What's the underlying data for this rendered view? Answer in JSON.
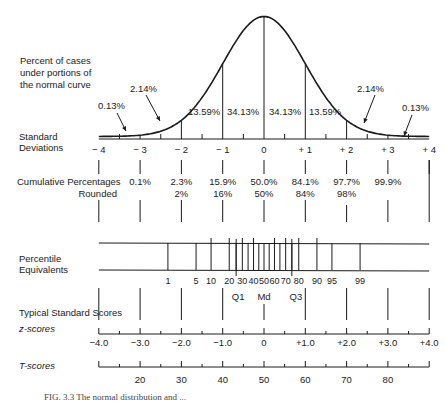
{
  "chart_data": {
    "type": "line",
    "caption": "FIG. 3.3  The normal distribution and ...",
    "curve_label": [
      "Percent of cases",
      "under portions of",
      "the normal curve"
    ],
    "standard_deviations": {
      "label": [
        "Standard",
        "Deviations"
      ],
      "ticks": [
        "− 4",
        "− 3",
        "− 2",
        "− 1",
        "0",
        "+ 1",
        "+ 2",
        "+ 3",
        "+ 4"
      ],
      "values": [
        -4,
        -3,
        -2,
        -1,
        0,
        1,
        2,
        3,
        4
      ]
    },
    "area_percentages": [
      {
        "from": -4,
        "to": -3,
        "value": "0.13%"
      },
      {
        "from": -3,
        "to": -2,
        "value": "2.14%"
      },
      {
        "from": -2,
        "to": -1,
        "value": "13.59%"
      },
      {
        "from": -1,
        "to": 0,
        "value": "34.13%"
      },
      {
        "from": 0,
        "to": 1,
        "value": "34.13%"
      },
      {
        "from": 1,
        "to": 2,
        "value": "13.59%"
      },
      {
        "from": 2,
        "to": 3,
        "value": "2.14%"
      },
      {
        "from": 3,
        "to": 4,
        "value": "0.13%"
      }
    ],
    "cumulative_percentages": {
      "label": "Cumulative Percentages",
      "rounded_label": "Rounded",
      "values": [
        "0.1%",
        "2.3%",
        "15.9%",
        "50.0%",
        "84.1%",
        "97.7%",
        "99.9%"
      ],
      "rounded": [
        "",
        "2%",
        "16%",
        "50%",
        "84%",
        "98%",
        ""
      ]
    },
    "percentile_equivalents": {
      "label": [
        "Percentile",
        "Equivalents"
      ],
      "values": [
        1,
        5,
        10,
        20,
        30,
        40,
        50,
        60,
        70,
        80,
        90,
        95,
        99
      ],
      "tick_labels": [
        "1",
        "5",
        "10",
        "20",
        "30",
        "40",
        "50",
        "60",
        "70",
        "80",
        "90",
        "95",
        "99"
      ],
      "quartiles": [
        "Q1",
        "Md",
        "Q3"
      ]
    },
    "typical_standard_scores_label": "Typical Standard Scores",
    "z_scores": {
      "label": "z-scores",
      "ticks": [
        "−4.0",
        "−3.0",
        "−2.0",
        "−1.0",
        "0",
        "+1.0",
        "+2.0",
        "+3.0",
        "+4.0"
      ],
      "values": [
        -4,
        -3,
        -2,
        -1,
        0,
        1,
        2,
        3,
        4
      ]
    },
    "t_scores": {
      "label": "T-scores",
      "ticks": [
        "20",
        "30",
        "40",
        "50",
        "60",
        "70",
        "80"
      ],
      "values": [
        20,
        30,
        40,
        50,
        60,
        70,
        80
      ]
    },
    "xlim": [
      -4,
      4
    ]
  }
}
